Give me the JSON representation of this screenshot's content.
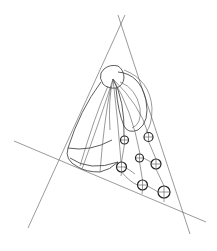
{
  "diagram": {
    "type": "perspective-construction-drawing",
    "background": "#ffffff",
    "stroke_color": "#333333",
    "construction_lines": [
      {
        "id": "left-line",
        "x1": 125,
        "y1": 15,
        "x2": 28,
        "y2": 228
      },
      {
        "id": "right-line",
        "x1": 118,
        "y1": 15,
        "x2": 190,
        "y2": 234
      },
      {
        "id": "base-line",
        "x1": 14,
        "y1": 141,
        "x2": 206,
        "y2": 222
      }
    ],
    "apex": {
      "x": 113,
      "y": 79
    },
    "cap": {
      "cx": 112,
      "cy": 76,
      "w": 24,
      "h": 24
    },
    "circles": [
      {
        "cx": 124.5,
        "cy": 140,
        "r": 4
      },
      {
        "cx": 148.5,
        "cy": 137,
        "r": 4.5
      },
      {
        "cx": 139.5,
        "cy": 158,
        "r": 4
      },
      {
        "cx": 156,
        "cy": 164,
        "r": 5
      },
      {
        "cx": 121.5,
        "cy": 167,
        "r": 5
      },
      {
        "cx": 142.5,
        "cy": 185,
        "r": 5
      },
      {
        "cx": 164,
        "cy": 192,
        "r": 6
      }
    ]
  }
}
